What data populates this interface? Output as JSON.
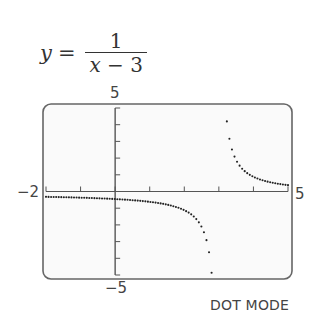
{
  "equation": {
    "lhs": "y",
    "equals": "=",
    "numerator": "1",
    "denominator_var": "x",
    "denominator_rest": " − 3"
  },
  "labels": {
    "ymax": "5",
    "ymin": "−5",
    "xmin": "−2",
    "xmax": "5",
    "mode": "DOT MODE"
  },
  "colors": {
    "frame": "#666666",
    "axis": "#555555",
    "dots": "#222222",
    "screen_bg": "#fafafa"
  },
  "chart_data": {
    "type": "scatter",
    "function": "1/(x-3)",
    "xlabel": "",
    "ylabel": "",
    "xlim": [
      -2,
      5
    ],
    "ylim": [
      -5,
      5
    ],
    "xscale": 1,
    "yscale": 1,
    "grid": false,
    "mode": "DOT MODE",
    "vertical_asymptote": 3,
    "horizontal_asymptote": 0,
    "tick_labels": {
      "x": [
        "−2",
        "5"
      ],
      "y": [
        "−5",
        "5"
      ]
    },
    "branches": [
      {
        "name": "left branch",
        "x_range": [
          -2,
          2.8
        ],
        "y_range": [
          -0.2,
          -5
        ]
      },
      {
        "name": "right branch",
        "x_range": [
          3.2,
          5
        ],
        "y_range": [
          5,
          0.5
        ]
      }
    ],
    "sample_points": [
      {
        "x": -2,
        "y": -0.2
      },
      {
        "x": -1,
        "y": -0.25
      },
      {
        "x": 0,
        "y": -0.333
      },
      {
        "x": 1,
        "y": -0.5
      },
      {
        "x": 2,
        "y": -1
      },
      {
        "x": 2.5,
        "y": -2
      },
      {
        "x": 2.8,
        "y": -5
      },
      {
        "x": 3.2,
        "y": 5
      },
      {
        "x": 3.5,
        "y": 2
      },
      {
        "x": 4,
        "y": 1
      },
      {
        "x": 5,
        "y": 0.5
      }
    ]
  }
}
